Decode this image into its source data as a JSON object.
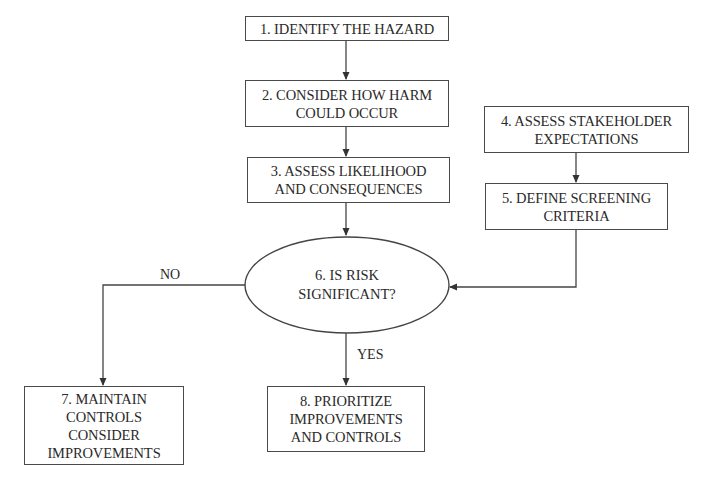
{
  "nodes": {
    "n1": {
      "lines": [
        "1. IDENTIFY THE HAZARD"
      ]
    },
    "n2": {
      "lines": [
        "2. CONSIDER HOW HARM",
        "COULD OCCUR"
      ]
    },
    "n3": {
      "lines": [
        "3. ASSESS LIKELIHOOD",
        "AND CONSEQUENCES"
      ]
    },
    "n4": {
      "lines": [
        "4. ASSESS STAKEHOLDER",
        "EXPECTATIONS"
      ]
    },
    "n5": {
      "lines": [
        "5. DEFINE SCREENING",
        "CRITERIA"
      ]
    },
    "n6": {
      "lines": [
        "6. IS RISK",
        "SIGNIFICANT?"
      ],
      "shape": "ellipse"
    },
    "n7": {
      "lines": [
        "7. MAINTAIN",
        "CONTROLS",
        "CONSIDER",
        "IMPROVEMENTS"
      ]
    },
    "n8": {
      "lines": [
        "8. PRIORITIZE",
        "IMPROVEMENTS",
        "AND CONTROLS"
      ]
    }
  },
  "edges": [
    {
      "from": "n1",
      "to": "n2",
      "label": ""
    },
    {
      "from": "n2",
      "to": "n3",
      "label": ""
    },
    {
      "from": "n3",
      "to": "n6",
      "label": ""
    },
    {
      "from": "n4",
      "to": "n5",
      "label": ""
    },
    {
      "from": "n5",
      "to": "n6",
      "label": ""
    },
    {
      "from": "n6",
      "to": "n7",
      "label": "NO"
    },
    {
      "from": "n6",
      "to": "n8",
      "label": "YES"
    }
  ],
  "labels": {
    "no": "NO",
    "yes": "YES"
  }
}
